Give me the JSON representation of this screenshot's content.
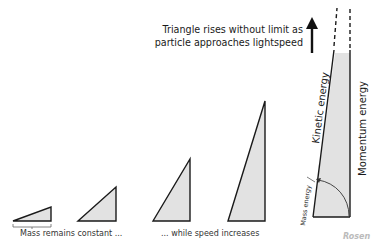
{
  "headline": {
    "line1": "Triangle rises without limit as",
    "line2": "particle approaches lightspeed"
  },
  "captions": {
    "left": "Mass remains constant ...",
    "right": "... while speed increases"
  },
  "labels": {
    "kinetic": "Kinetic energy",
    "momentum": "Momentum energy",
    "mass": "Mass energy"
  },
  "logo": "Rosen",
  "colors": {
    "fill": "#e2e2e2",
    "stroke": "#1a1a1a"
  },
  "triangles": [
    {
      "left": 13,
      "right": 51,
      "top": 207,
      "bottom": 221
    },
    {
      "left": 78,
      "right": 116,
      "top": 187,
      "bottom": 221
    },
    {
      "left": 153,
      "right": 190,
      "top": 159,
      "bottom": 221
    },
    {
      "left": 228,
      "right": 265,
      "top": 101,
      "bottom": 221
    }
  ]
}
